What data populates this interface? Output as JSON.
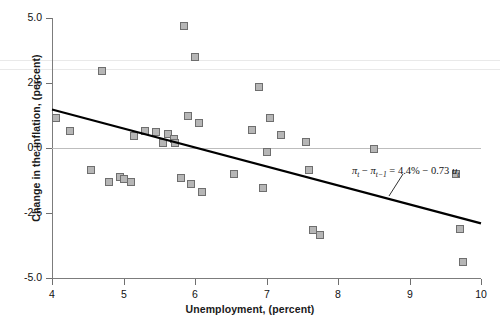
{
  "chart_data": {
    "type": "scatter",
    "title": "",
    "xlabel": "Unemployment, (percent)",
    "ylabel": "Change in the inflation, (percent)",
    "xlim": [
      4,
      10
    ],
    "ylim": [
      -5.0,
      5.0
    ],
    "xticks": [
      "4",
      "5",
      "6",
      "7",
      "8",
      "9",
      "10"
    ],
    "xtick_values": [
      4,
      5,
      6,
      7,
      8,
      9,
      10
    ],
    "yticks": [
      "5.0",
      "2.5",
      "0.0",
      "-2.5",
      "-5.0"
    ],
    "ytick_values": [
      5.0,
      2.5,
      0.0,
      -2.5,
      -5.0
    ],
    "grid": false,
    "zero_reference_line": 0.0,
    "legend": "none",
    "marker": {
      "shape": "square",
      "fill": "#b6b6b6",
      "edge": "#6e6e6e",
      "size_px": 8
    },
    "points": [
      {
        "x": 4.05,
        "y": 1.15
      },
      {
        "x": 4.25,
        "y": 0.65
      },
      {
        "x": 4.55,
        "y": -0.85
      },
      {
        "x": 4.7,
        "y": 2.95
      },
      {
        "x": 4.8,
        "y": -1.3
      },
      {
        "x": 4.95,
        "y": -1.1
      },
      {
        "x": 5.0,
        "y": -1.2
      },
      {
        "x": 5.1,
        "y": -1.3
      },
      {
        "x": 5.15,
        "y": 0.45
      },
      {
        "x": 5.3,
        "y": 0.65
      },
      {
        "x": 5.45,
        "y": 0.6
      },
      {
        "x": 5.55,
        "y": 0.2
      },
      {
        "x": 5.62,
        "y": 0.55
      },
      {
        "x": 5.7,
        "y": 0.35
      },
      {
        "x": 5.72,
        "y": 0.2
      },
      {
        "x": 5.8,
        "y": -1.15
      },
      {
        "x": 5.85,
        "y": 4.7
      },
      {
        "x": 5.9,
        "y": 1.25
      },
      {
        "x": 5.95,
        "y": -1.4
      },
      {
        "x": 6.0,
        "y": 3.5
      },
      {
        "x": 6.05,
        "y": 0.95
      },
      {
        "x": 6.1,
        "y": -1.7
      },
      {
        "x": 6.55,
        "y": -1.0
      },
      {
        "x": 6.8,
        "y": 0.7
      },
      {
        "x": 6.9,
        "y": 2.35
      },
      {
        "x": 6.95,
        "y": -1.55
      },
      {
        "x": 7.0,
        "y": -0.15
      },
      {
        "x": 7.05,
        "y": 1.15
      },
      {
        "x": 7.2,
        "y": 0.5
      },
      {
        "x": 7.55,
        "y": 0.25
      },
      {
        "x": 7.6,
        "y": -0.85
      },
      {
        "x": 7.65,
        "y": -3.15
      },
      {
        "x": 7.75,
        "y": -3.35
      },
      {
        "x": 8.5,
        "y": -0.05
      },
      {
        "x": 9.65,
        "y": -1.0
      },
      {
        "x": 9.7,
        "y": -3.1
      },
      {
        "x": 9.75,
        "y": -4.4
      }
    ],
    "fit_line": {
      "intercept": 4.4,
      "slope": -0.73,
      "x_start": 4.0,
      "x_end": 10.0,
      "color": "#000000",
      "width_px": 2.2
    },
    "annotation": {
      "text": "πt − πt−1 = 4.4% − 0.73 ut",
      "parts": {
        "pi": "π",
        "sub_t": "t",
        "sub_t1": "t−1",
        "minus": "−",
        "equals": "=",
        "intercept": "4.4%",
        "slope": "0.73",
        "u": "u"
      },
      "leader_line": true
    }
  }
}
